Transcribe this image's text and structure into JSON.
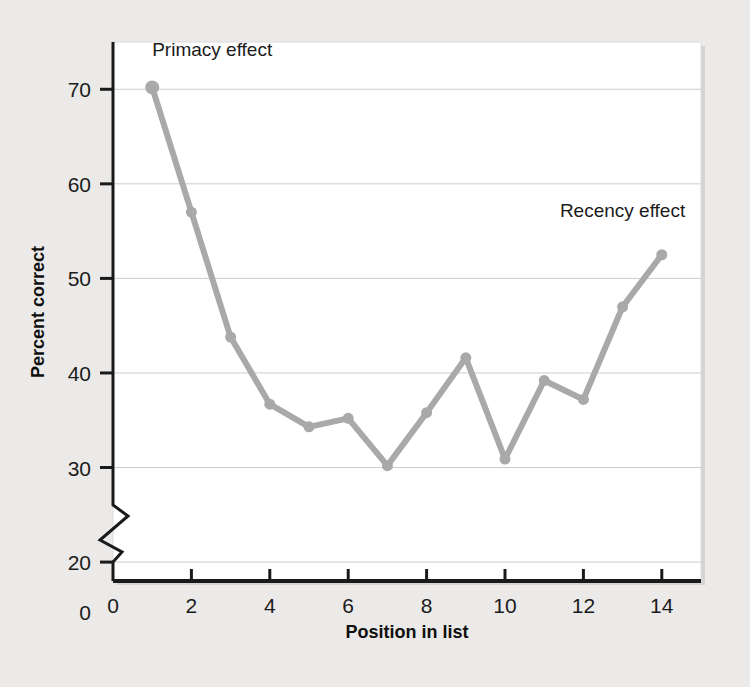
{
  "figure": {
    "background_color": "#eceae8",
    "plot_background_color": "#ffffff",
    "plot_border_color": "#d8d8d8"
  },
  "chart_data": {
    "type": "line",
    "title": "",
    "subtitle": "",
    "xlabel": "Position in list",
    "ylabel": "Percent correct",
    "x": [
      1,
      2,
      3,
      4,
      5,
      6,
      7,
      8,
      9,
      10,
      11,
      12,
      13,
      14
    ],
    "values": [
      70.2,
      57.0,
      43.8,
      36.7,
      34.3,
      35.2,
      30.2,
      35.8,
      41.6,
      30.9,
      39.2,
      37.2,
      47.0,
      52.5
    ],
    "series": [
      {
        "name": "Percent correct",
        "values": [
          70.2,
          57.0,
          43.8,
          36.7,
          34.3,
          35.2,
          30.2,
          35.8,
          41.6,
          30.9,
          39.2,
          37.2,
          47.0,
          52.5
        ],
        "color": "#a9a9a9"
      }
    ],
    "xlim": [
      0,
      15
    ],
    "ylim": [
      18,
      75
    ],
    "xticks": [
      0,
      2,
      4,
      6,
      8,
      10,
      12,
      14
    ],
    "xtick_labels": [
      "0",
      "2",
      "4",
      "6",
      "8",
      "10",
      "12",
      "14"
    ],
    "yticks": [
      20,
      30,
      40,
      50,
      60,
      70
    ],
    "ytick_labels": [
      "20",
      "30",
      "40",
      "50",
      "60",
      "70"
    ],
    "y_axis_break": true,
    "y_axis_break_label": "0",
    "grid": true,
    "grid_axis": "y",
    "grid_color": "#cccccc",
    "legend": null,
    "legend_position": "none",
    "marker": "circle",
    "line_width": 6,
    "annotations": [
      {
        "id": "primacy",
        "text": "Primacy effect",
        "x": 1.0,
        "y": 73.5,
        "anchor": "start"
      },
      {
        "id": "recency",
        "text": "Recency effect",
        "x": 11.4,
        "y": 56.5,
        "anchor": "start"
      }
    ]
  },
  "axes": {
    "y_title": "Percent correct",
    "x_title": "Position in list",
    "y_zero_label": "0"
  }
}
